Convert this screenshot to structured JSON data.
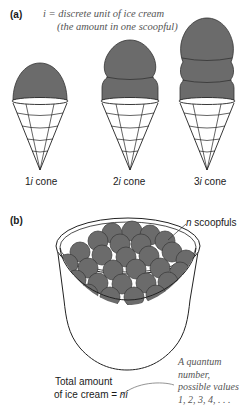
{
  "panel_a": {
    "label": "(a)",
    "definition_line1": "i = discrete unit of ice cream",
    "definition_line2": "(the amount in one scoopful)",
    "cones": [
      {
        "coef": "1",
        "var": "i",
        "suffix": " cone",
        "scoops": 1
      },
      {
        "coef": "2",
        "var": "i",
        "suffix": " cone",
        "scoops": 2
      },
      {
        "coef": "3",
        "var": "i",
        "suffix": " cone",
        "scoops": 3
      }
    ]
  },
  "panel_b": {
    "label": "(b)",
    "scoop_label_var": "n",
    "scoop_label_text": " scoopfuls",
    "total_line1": "Total amount",
    "total_line2": "of ice cream = ",
    "total_expr": "ni",
    "quantum_line1": "A quantum",
    "quantum_line2": "number,",
    "quantum_line3": "possible values",
    "quantum_line4": "1, 2, 3, 4, . . ."
  },
  "colors": {
    "ice_cream": "#6b6b6b",
    "outline": "#222222",
    "annotation": "#555555"
  }
}
